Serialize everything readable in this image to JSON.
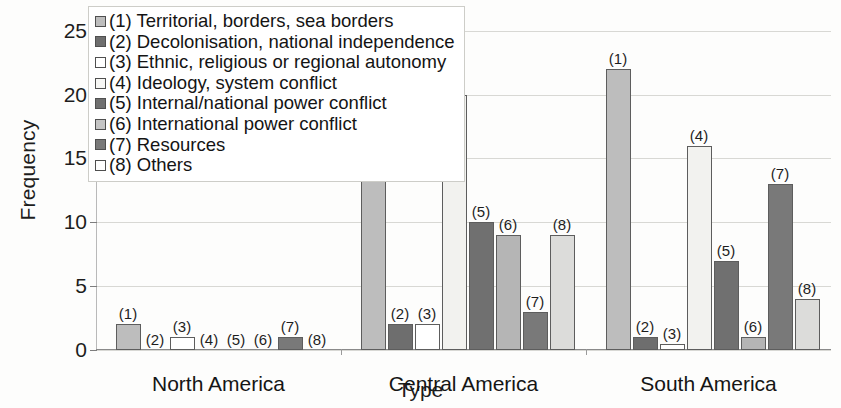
{
  "chart_data": {
    "type": "bar",
    "title": "",
    "xlabel": "Type",
    "ylabel": "Frequency",
    "ylim": [
      0,
      26
    ],
    "yticks": [
      0,
      5,
      10,
      15,
      20,
      25
    ],
    "grid": true,
    "legend_position": "upper-left",
    "categories": [
      "North America",
      "Central America",
      "South America"
    ],
    "series": [
      {
        "key": "1",
        "name": "(1) Territorial, borders, sea borders",
        "color": "#bdbdbd",
        "values": [
          2,
          14,
          22
        ]
      },
      {
        "key": "2",
        "name": "(2) Decolonisation, national independence",
        "color": "#6e6e6e",
        "values": [
          0,
          2,
          1
        ]
      },
      {
        "key": "3",
        "name": "(3) Ethnic, religious or regional autonomy",
        "color": "#ffffff",
        "values": [
          1,
          2,
          0.5
        ]
      },
      {
        "key": "4",
        "name": "(4) Ideology, system conflict",
        "color": "#f2f2ef",
        "values": [
          0,
          20,
          16
        ]
      },
      {
        "key": "5",
        "name": "(5) Internal/national power conflict",
        "color": "#707070",
        "values": [
          0,
          10,
          7
        ]
      },
      {
        "key": "6",
        "name": "(6) International power conflict",
        "color": "#b5b5b5",
        "values": [
          0,
          9,
          1
        ]
      },
      {
        "key": "7",
        "name": "(7) Resources",
        "color": "#797979",
        "values": [
          1,
          3,
          13
        ]
      },
      {
        "key": "8",
        "name": "(8) Others",
        "color": "#dcdcda",
        "values": [
          0,
          9,
          4
        ]
      }
    ],
    "point_labels": {
      "North America": [
        "(1)",
        "(2)",
        "(3)",
        "(4)",
        "(5)",
        "(6)",
        "(7)",
        "(8)"
      ],
      "Central America": [
        "(1)",
        "(2)",
        "(3)",
        "(4)",
        "(5)",
        "(6)",
        "(7)",
        "(8)"
      ],
      "South America": [
        "(1)",
        "(2)",
        "(3)",
        "(4)",
        "(5)",
        "(6)",
        "(7)",
        "(8)"
      ]
    }
  },
  "legend": {
    "items": [
      {
        "label": "(1) Territorial, borders, sea borders",
        "swatch": "#bdbdbd"
      },
      {
        "label": "(2) Decolonisation, national independence",
        "swatch": "#6e6e6e"
      },
      {
        "label": "(3) Ethnic, religious or regional autonomy",
        "swatch": "#ffffff"
      },
      {
        "label": "(4) Ideology, system conflict",
        "swatch": "#f7f7f5"
      },
      {
        "label": "(5) Internal/national power conflict",
        "swatch": "#707070"
      },
      {
        "label": "(6) International power conflict",
        "swatch": "#c4c4c4"
      },
      {
        "label": "(7) Resources",
        "swatch": "#797979"
      },
      {
        "label": "(8) Others",
        "swatch": "#ffffff"
      }
    ]
  },
  "axes": {
    "y_title": "Frequency",
    "x_title": "Type",
    "y_tick_labels": [
      "0",
      "5",
      "10",
      "15",
      "20",
      "25"
    ]
  }
}
